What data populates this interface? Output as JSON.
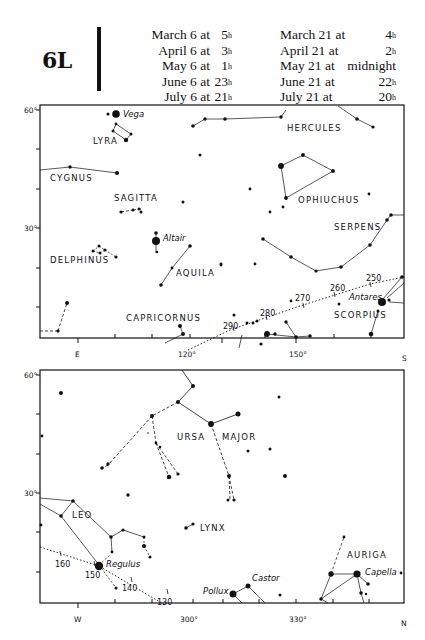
{
  "header": {
    "map_id": "6L",
    "times_left": [
      {
        "label": "March 6 at",
        "value": "5",
        "unit": "h"
      },
      {
        "label": "April 6 at",
        "value": "3",
        "unit": "h"
      },
      {
        "label": "May 6 at",
        "value": "1",
        "unit": "h"
      },
      {
        "label": "June 6 at",
        "value": "23",
        "unit": "h"
      },
      {
        "label": "July 6 at",
        "value": "21",
        "unit": "h"
      }
    ],
    "times_right": [
      {
        "label": "March 21 at",
        "value": "4",
        "unit": "h"
      },
      {
        "label": "April 21 at",
        "value": "2",
        "unit": "h"
      },
      {
        "label": "May 21 at",
        "value": "midnight",
        "unit": ""
      },
      {
        "label": "June 21 at",
        "value": "22",
        "unit": "h"
      },
      {
        "label": "July 21 at",
        "value": "20",
        "unit": "h"
      }
    ]
  },
  "top_chart": {
    "frame": {
      "x": 40,
      "y": 105,
      "w": 364,
      "h": 233
    },
    "y_labels": [
      {
        "text": "60°",
        "y": 110
      },
      {
        "text": "30°",
        "y": 228
      }
    ],
    "y_ticks": [
      110,
      149,
      189,
      228,
      268,
      307
    ],
    "x_ticks": [
      {
        "x": 78,
        "label": "E"
      },
      {
        "x": 115,
        "label": ""
      },
      {
        "x": 152,
        "label": ""
      },
      {
        "x": 190,
        "label": ""
      },
      {
        "x": 228,
        "label": "120°"
      },
      {
        "x": 265,
        "label": ""
      },
      {
        "x": 302,
        "label": ""
      },
      {
        "x": 340,
        "label": ""
      },
      {
        "x": 371,
        "label": ""
      },
      {
        "x": 404,
        "label": "S"
      }
    ],
    "x_labels": [
      {
        "text": "E",
        "x": 78,
        "y": 357
      },
      {
        "text": "120°",
        "x": 188,
        "y": 357
      },
      {
        "text": "150°",
        "x": 299,
        "y": 357
      },
      {
        "text": "S",
        "x": 405,
        "y": 361
      }
    ],
    "constellation_labels": [
      {
        "text": "LYRA",
        "x": 93,
        "y": 144
      },
      {
        "text": "HERCULES",
        "x": 287,
        "y": 131
      },
      {
        "text": "CYGNUS",
        "x": 50,
        "y": 181
      },
      {
        "text": "SAGITTA",
        "x": 114,
        "y": 201
      },
      {
        "text": "OPHIUCHUS",
        "x": 299,
        "y": 203
      },
      {
        "text": "SERPENS",
        "x": 334,
        "y": 230
      },
      {
        "text": "DELPHINUS",
        "x": 50,
        "y": 263
      },
      {
        "text": "AQUILA",
        "x": 176,
        "y": 276
      },
      {
        "text": "CAPRICORNUS",
        "x": 126,
        "y": 321
      },
      {
        "text": "SCORPIUS",
        "x": 334,
        "y": 318
      }
    ],
    "star_labels": [
      {
        "text": "Vega",
        "x": 122,
        "y": 117
      },
      {
        "text": "Altair",
        "x": 163,
        "y": 241
      },
      {
        "text": "Antares",
        "x": 350,
        "y": 301
      }
    ],
    "ecliptic_labels": [
      {
        "text": "250",
        "x": 368,
        "y": 282
      },
      {
        "text": "260",
        "x": 332,
        "y": 291
      },
      {
        "text": "270",
        "x": 295,
        "y": 301
      },
      {
        "text": "280",
        "x": 261,
        "y": 315
      },
      {
        "text": "290",
        "x": 224,
        "y": 328
      }
    ]
  },
  "bottom_chart": {
    "frame": {
      "x": 40,
      "y": 370,
      "w": 364,
      "h": 233
    },
    "y_labels": [
      {
        "text": "60°",
        "y": 375
      },
      {
        "text": "30°",
        "y": 493
      }
    ],
    "y_ticks": [
      375,
      414,
      454,
      493,
      532,
      572
    ],
    "x_labels": [
      {
        "text": "W",
        "x": 78,
        "y": 622
      },
      {
        "text": "300°",
        "x": 189,
        "y": 622
      },
      {
        "text": "330°",
        "x": 296,
        "y": 622
      },
      {
        "text": "N",
        "x": 404,
        "y": 626
      }
    ],
    "constellation_labels": [
      {
        "text": "URSA",
        "x": 177,
        "y": 440
      },
      {
        "text": "MAJOR",
        "x": 222,
        "y": 440
      },
      {
        "text": "LEO",
        "x": 72,
        "y": 518
      },
      {
        "text": "LYNX",
        "x": 199,
        "y": 531
      },
      {
        "text": "AURIGA",
        "x": 347,
        "y": 558
      }
    ],
    "star_labels": [
      {
        "text": "Regulus",
        "x": 106,
        "y": 567
      },
      {
        "text": "Castor",
        "x": 252,
        "y": 581
      },
      {
        "text": "Pollux",
        "x": 204,
        "y": 594
      },
      {
        "text": "Capella",
        "x": 366,
        "y": 575
      }
    ],
    "ecliptic_labels": [
      {
        "text": "160",
        "x": 55,
        "y": 568
      },
      {
        "text": "150",
        "x": 86,
        "y": 577
      },
      {
        "text": "140",
        "x": 122,
        "y": 591
      },
      {
        "text": "130",
        "x": 158,
        "y": 605
      }
    ]
  }
}
